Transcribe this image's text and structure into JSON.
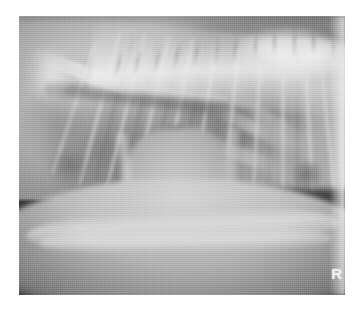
{
  "viewer": {
    "background_color": "#ffffff",
    "image_type": "radiograph",
    "modality": "X-ray",
    "view": "lateral-thorax",
    "width_px": 358,
    "height_px": 314
  },
  "radiograph": {
    "left_px": 19,
    "top_px": 16,
    "width_px": 326,
    "height_px": 279,
    "film_base_color": "#8d8d8d",
    "air_background_color": "#2e2e2e",
    "bone_highlight_color": "#ededed",
    "soft_tissue_color": "#bcbcbc",
    "lung_field_color": "#6e6e6e"
  },
  "markers": {
    "side_marker": "R",
    "side_marker_color": "#f2f2f2"
  },
  "anatomy": {
    "regions": [
      {
        "name": "thoracic-spine",
        "label": "Thoracic spine"
      },
      {
        "name": "rib-cage",
        "label": "Rib cage"
      },
      {
        "name": "cardiac-silhouette",
        "label": "Cardiac silhouette"
      },
      {
        "name": "trachea",
        "label": "Trachea"
      },
      {
        "name": "carina",
        "label": "Carina"
      },
      {
        "name": "lung-cranial",
        "label": "Cranial lung lobe"
      },
      {
        "name": "lung-caudodorsal",
        "label": "Caudodorsal lung field"
      },
      {
        "name": "diaphragm",
        "label": "Diaphragm"
      },
      {
        "name": "caudal-vena-cava",
        "label": "Caudal vena cava"
      },
      {
        "name": "sternum",
        "label": "Sternum"
      },
      {
        "name": "scapula",
        "label": "Scapula"
      },
      {
        "name": "ventral-body-wall",
        "label": "Ventral body wall"
      },
      {
        "name": "focal-opacity",
        "label": "Focal opacity"
      }
    ],
    "rib_count": 11,
    "vertebra_count": 12
  }
}
